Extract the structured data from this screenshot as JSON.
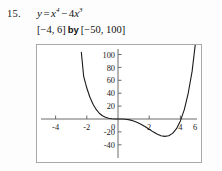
{
  "problem": {
    "number": "15.",
    "equation_prefix": "y",
    "equation_equals": "=",
    "equation_term1_base": "x",
    "equation_term1_exp": "4",
    "equation_minus": "−",
    "equation_term2_coef": "4",
    "equation_term2_base": "x",
    "equation_term2_exp": "3",
    "equation_plain": "y = x⁴ − 4x³",
    "window_x": "[−4, 6]",
    "window_by": "by",
    "window_y": "[−50, 100]"
  },
  "chart_data": {
    "type": "line",
    "title": "",
    "subtitle": "",
    "xlabel": "",
    "ylabel": "",
    "function": "y = x^4 - 4x^3",
    "xlim": [
      -4,
      6
    ],
    "ylim": [
      -50,
      100
    ],
    "grid": false,
    "legend": null,
    "axes_shown": true,
    "x_ticks": [
      -4,
      -2,
      0,
      2,
      4,
      6
    ],
    "x_tick_labels": [
      "-4",
      "-2",
      "0",
      "2",
      "4",
      "6"
    ],
    "y_ticks": [
      -40,
      -20,
      20,
      40,
      60,
      80,
      100
    ],
    "y_tick_labels": [
      "-40",
      "-20",
      "20",
      "40",
      "60",
      "80",
      "100"
    ],
    "origin_label": "0",
    "series": [
      {
        "name": "y = x^4 - 4x^3",
        "x": [
          -2.35,
          -2.2,
          -2.0,
          -1.8,
          -1.6,
          -1.4,
          -1.2,
          -1.0,
          -0.8,
          -0.6,
          -0.4,
          -0.2,
          0.0,
          0.25,
          0.5,
          0.75,
          1.0,
          1.25,
          1.5,
          1.75,
          2.0,
          2.25,
          2.5,
          2.75,
          3.0,
          3.25,
          3.5,
          3.75,
          4.0,
          4.25,
          4.5,
          4.75,
          5.0,
          5.1
        ],
        "y": [
          103.5,
          66.0,
          48.0,
          33.7,
          22.9,
          14.8,
          8.9,
          5.0,
          2.6,
          1.1,
          0.3,
          0.03,
          0.0,
          -0.06,
          -0.44,
          -1.37,
          -3.0,
          -5.37,
          -8.44,
          -12.06,
          -16.0,
          -19.9,
          -23.4,
          -26.0,
          -27.0,
          -26.0,
          -22.3,
          -15.0,
          -3.0,
          14.6,
          39.9,
          73.8,
          125.0,
          148.0
        ],
        "roots": [
          0,
          4
        ],
        "local_min_x": 3,
        "local_min_y": -27,
        "inflection_points": [
          0,
          2
        ],
        "color": "#1a1a1a"
      }
    ],
    "axis_color": "#6b6b6b",
    "curve_color": "#1a1a1a",
    "border_color": "#a8a8a8",
    "background": "#ffffff"
  }
}
